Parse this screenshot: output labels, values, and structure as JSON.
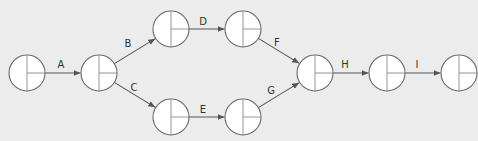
{
  "diagram": {
    "type": "activity-on-arrow network",
    "node_radius": 18,
    "colors": {
      "background": "#ececec",
      "node_fill": "#ffffff",
      "node_stroke": "#6a6a6a",
      "edge": "#555555",
      "label": "#333333"
    },
    "nodes": [
      {
        "id": "n1",
        "x": 27,
        "y": 73
      },
      {
        "id": "n2",
        "x": 99,
        "y": 73
      },
      {
        "id": "n3",
        "x": 171,
        "y": 29
      },
      {
        "id": "n4",
        "x": 243,
        "y": 29
      },
      {
        "id": "n5",
        "x": 171,
        "y": 117
      },
      {
        "id": "n6",
        "x": 243,
        "y": 117
      },
      {
        "id": "n7",
        "x": 315,
        "y": 73
      },
      {
        "id": "n8",
        "x": 387,
        "y": 73
      },
      {
        "id": "n9",
        "x": 459,
        "y": 73
      }
    ],
    "edges": [
      {
        "label": "A",
        "from": "n1",
        "to": "n2",
        "lx": 61,
        "ly": 68
      },
      {
        "label": "B",
        "from": "n2",
        "to": "n3",
        "lx": 128,
        "ly": 47
      },
      {
        "label": "C",
        "from": "n2",
        "to": "n5",
        "lx": 134,
        "ly": 91
      },
      {
        "label": "D",
        "from": "n3",
        "to": "n4",
        "lx": 203,
        "ly": 25
      },
      {
        "label": "E",
        "from": "n5",
        "to": "n6",
        "lx": 203,
        "ly": 113
      },
      {
        "label": "F",
        "from": "n4",
        "to": "n7",
        "lx": 277,
        "ly": 46
      },
      {
        "label": "G",
        "from": "n6",
        "to": "n7",
        "lx": 271,
        "ly": 94
      },
      {
        "label": "H",
        "from": "n7",
        "to": "n8",
        "lx": 345,
        "ly": 68
      },
      {
        "label": "I",
        "from": "n8",
        "to": "n9",
        "lx": 417,
        "ly": 68
      }
    ]
  }
}
